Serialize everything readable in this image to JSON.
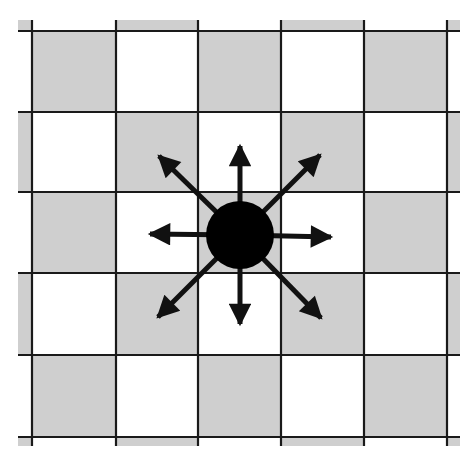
{
  "diagram": {
    "type": "lattice-diffusion",
    "colors": {
      "background": "#ffffff",
      "shaded_cell": "#cfcfcf",
      "white_cell": "#ffffff",
      "grid_line": "#1a1a1a",
      "particle": "#000000",
      "arrow": "#111111"
    },
    "grid": {
      "x_lines": [
        32,
        116,
        198,
        281,
        364,
        447
      ],
      "y_lines": [
        31,
        112,
        192,
        273,
        355,
        437
      ],
      "x_extent": [
        18,
        460
      ],
      "y_extent": [
        20,
        446
      ],
      "shaded_pattern": "checkerboard, top-left interior cell shaded"
    },
    "particle": {
      "cx": 240,
      "cy": 235,
      "r": 34
    },
    "arrows": [
      {
        "direction": "N",
        "x2": 240,
        "y2": 146
      },
      {
        "direction": "NE",
        "x2": 320,
        "y2": 155
      },
      {
        "direction": "E",
        "x2": 331,
        "y2": 237
      },
      {
        "direction": "SE",
        "x2": 321,
        "y2": 318
      },
      {
        "direction": "S",
        "x2": 240,
        "y2": 324
      },
      {
        "direction": "SW",
        "x2": 158,
        "y2": 317
      },
      {
        "direction": "W",
        "x2": 150,
        "y2": 234
      },
      {
        "direction": "NW",
        "x2": 159,
        "y2": 156
      }
    ]
  }
}
